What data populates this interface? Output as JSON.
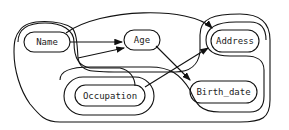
{
  "diagram": {
    "type": "dependency graph with groupings",
    "nodes": [
      {
        "id": "name",
        "label": "Name"
      },
      {
        "id": "age",
        "label": "Age"
      },
      {
        "id": "address",
        "label": "Address"
      },
      {
        "id": "occupation",
        "label": "Occupation"
      },
      {
        "id": "birth_date",
        "label": "Birth_date"
      }
    ],
    "edges": [
      {
        "from": "Name",
        "to": "Age"
      },
      {
        "from": "Name group",
        "to": "Age"
      },
      {
        "from": "Name",
        "to": "Address"
      },
      {
        "from": "Age",
        "to": "Birth_date"
      },
      {
        "from": "Occupation",
        "to": "Address"
      }
    ],
    "colors": {
      "stroke": "#111111",
      "background": "#ffffff"
    }
  }
}
